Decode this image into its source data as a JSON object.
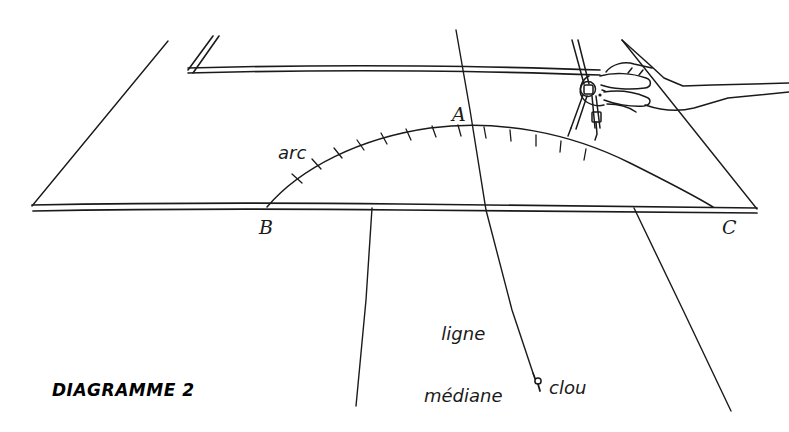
{
  "figure": {
    "caption": "DIAGRAMME 2",
    "language": "fr",
    "style": "hand-drawn line illustration",
    "ink_color": "#1a1a1a",
    "background_color": "#ffffff"
  },
  "labels": {
    "arc": "arc",
    "point_a": "A",
    "point_b": "B",
    "point_c": "C",
    "median_line_1": "ligne",
    "median_line_2": "médiane",
    "nail": "clou"
  },
  "scene": {
    "board_name": "workbench board",
    "tool_name": "compass-divider",
    "hand_name": "hand holding compass",
    "arc_tick_count": 13,
    "description_parts": [
      "board front edge",
      "board back edge",
      "board left bevel",
      "board right bevel",
      "arc from B through A to C",
      "median line through A to nail",
      "left leg line",
      "right leg line",
      "hand and compass"
    ]
  }
}
